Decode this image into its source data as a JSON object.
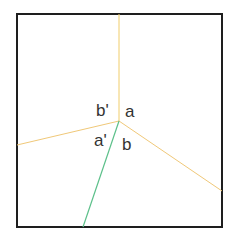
{
  "diagram": {
    "frame": {
      "x": 17,
      "y": 14,
      "width": 205,
      "height": 213,
      "stroke": "#1e1e1e",
      "stroke_width": 2
    },
    "center": {
      "x": 119,
      "y": 121
    },
    "edges": [
      {
        "id": "top",
        "to": {
          "x": 119,
          "y": 14
        },
        "color": "#f0cd6a"
      },
      {
        "id": "left",
        "to": {
          "x": 17,
          "y": 145
        },
        "color": "#f0c878"
      },
      {
        "id": "right",
        "to": {
          "x": 222,
          "y": 191
        },
        "color": "#f0c878"
      },
      {
        "id": "bottom",
        "to": {
          "x": 83,
          "y": 227
        },
        "color": "#5cc08a"
      }
    ],
    "labels": [
      {
        "id": "b-prime",
        "text": "b'",
        "x": 96,
        "y": 116
      },
      {
        "id": "a",
        "text": "a",
        "x": 125,
        "y": 117
      },
      {
        "id": "a-prime",
        "text": "a'",
        "x": 94,
        "y": 146
      },
      {
        "id": "b",
        "text": "b",
        "x": 122,
        "y": 150
      }
    ]
  }
}
